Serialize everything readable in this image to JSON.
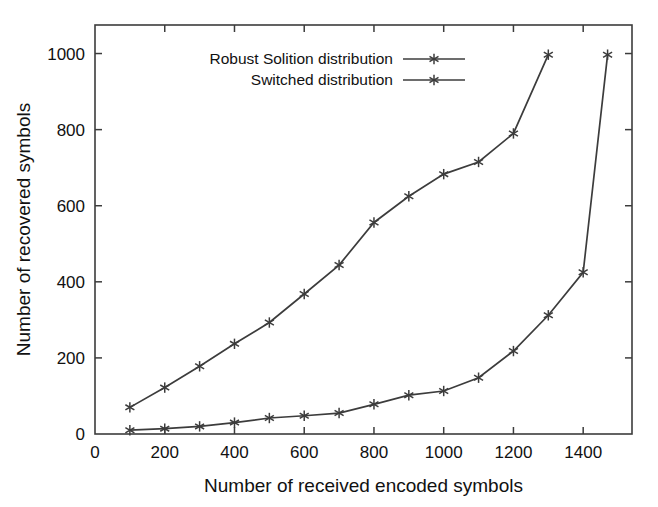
{
  "chart_data": {
    "type": "line",
    "title": "",
    "xlabel": "Number of received encoded symbols",
    "ylabel": "Number of recovered symbols",
    "xlim": [
      0,
      1540
    ],
    "ylim": [
      0,
      1075
    ],
    "xticks": [
      0,
      200,
      400,
      600,
      800,
      1000,
      1200,
      1400
    ],
    "yticks": [
      0,
      200,
      400,
      600,
      800,
      1000
    ],
    "xtick_labels": [
      "0",
      "200",
      "400",
      "600",
      "800",
      "1000",
      "1200",
      "1400"
    ],
    "ytick_labels": [
      "0",
      "200",
      "400",
      "600",
      "800",
      "1000"
    ],
    "grid": false,
    "legend_position": "top-center",
    "marker": "asterisk",
    "line_color": "#3c3c3c",
    "series": [
      {
        "name": "Robust Solition distribution",
        "x": [
          100,
          200,
          300,
          400,
          500,
          600,
          700,
          800,
          900,
          1000,
          1100,
          1200,
          1300
        ],
        "y": [
          70,
          122,
          178,
          237,
          293,
          368,
          444,
          556,
          625,
          683,
          715,
          790,
          997
        ]
      },
      {
        "name": "Switched distribution",
        "x": [
          100,
          200,
          300,
          400,
          500,
          600,
          700,
          800,
          900,
          1000,
          1100,
          1200,
          1300,
          1400,
          1470
        ],
        "y": [
          10,
          14,
          20,
          30,
          42,
          48,
          55,
          78,
          102,
          113,
          148,
          218,
          312,
          425,
          997
        ]
      }
    ]
  },
  "legend": {
    "entries": [
      {
        "label": "Robust Solition distribution"
      },
      {
        "label": "Switched distribution"
      }
    ]
  },
  "axes": {
    "x_title": "Number of received encoded symbols",
    "y_title": "Number of recovered symbols"
  }
}
